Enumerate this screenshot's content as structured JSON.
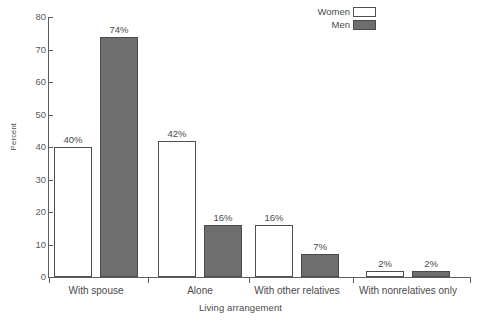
{
  "chart_data": {
    "type": "bar",
    "title": "",
    "xlabel": "Living arrangement",
    "ylabel": "Percent",
    "ylim": [
      0,
      80
    ],
    "yticks": [
      0,
      10,
      20,
      30,
      40,
      50,
      60,
      70,
      80
    ],
    "ytick_labels": [
      "0",
      "10",
      "20",
      "30",
      "40",
      "50",
      "60",
      "70",
      "80"
    ],
    "grid": false,
    "legend_position": "top-right",
    "categories": [
      "With spouse",
      "Alone",
      "With other relatives",
      "With nonrelatives only"
    ],
    "series": [
      {
        "name": "Women",
        "color": "#ffffff",
        "values": [
          40,
          42,
          16,
          2
        ],
        "data_labels": [
          "40%",
          "42%",
          "16%",
          "2%"
        ]
      },
      {
        "name": "Men",
        "color": "#6e6e6e",
        "values": [
          74,
          16,
          7,
          2
        ],
        "data_labels": [
          "74%",
          "16%",
          "7%",
          "2%"
        ]
      }
    ]
  },
  "legend": {
    "items": [
      {
        "label": "Women",
        "swatch": "white"
      },
      {
        "label": "Men",
        "swatch": "gray"
      }
    ]
  },
  "axes": {
    "y_title": "Percent",
    "x_title": "Living arrangement"
  },
  "colors": {
    "men_fill": "#6e6e6e",
    "women_fill": "#ffffff",
    "axis": "#5d5d5d",
    "text": "#4a4a4a"
  }
}
